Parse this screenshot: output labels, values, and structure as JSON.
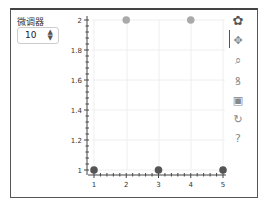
{
  "widget": {
    "label": "微调器",
    "value": "10"
  },
  "toolbar": {
    "items": [
      {
        "name": "bokeh-logo-icon",
        "glyph": "✿"
      },
      {
        "name": "pan-icon",
        "glyph": "✥"
      },
      {
        "name": "box-zoom-icon",
        "glyph": "⌕"
      },
      {
        "name": "wheel-zoom-icon",
        "glyph": "ꝸ"
      },
      {
        "name": "save-icon",
        "glyph": "▣"
      },
      {
        "name": "reset-icon",
        "glyph": "↻"
      },
      {
        "name": "help-icon",
        "glyph": "?"
      }
    ]
  },
  "chart_data": {
    "type": "scatter",
    "x": [
      1,
      2,
      3,
      4,
      5
    ],
    "y": [
      1,
      2,
      1,
      2,
      1
    ],
    "colors": [
      "#555555",
      "#aaaaaa",
      "#555555",
      "#aaaaaa",
      "#555555"
    ],
    "xticks": [
      "1",
      "2",
      "3",
      "4",
      "5"
    ],
    "yticks": [
      "1",
      "1.2",
      "1.4",
      "1.6",
      "1.8",
      "2"
    ],
    "xlim": [
      0.95,
      5.05
    ],
    "ylim": [
      0.97,
      2.03
    ],
    "grid": true,
    "title": "",
    "xlabel": "",
    "ylabel": ""
  }
}
